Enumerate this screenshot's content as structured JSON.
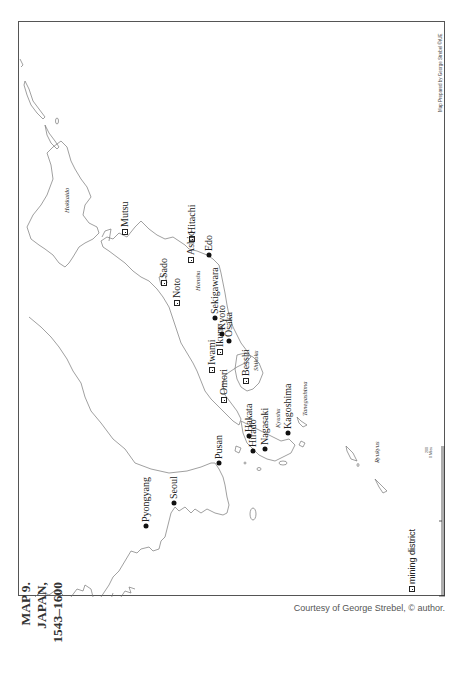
{
  "map": {
    "title_lines": [
      "MAP 9.",
      "JAPAN,",
      "1543–1600"
    ],
    "caption": "Courtesy of George Strebel, © author.",
    "credit_vertical": "Map Prepared by George Strebel  ©rUE",
    "legend": {
      "icon": "mining-district-icon",
      "label": "mining district"
    },
    "scale_bar": {
      "label_top": "200",
      "label_bottom": "0 Miles"
    },
    "colors": {
      "frame": "#555555",
      "coast": "#777777",
      "text": "#222222",
      "caption": "#555555"
    },
    "regions": [
      {
        "name": "Hokkaido",
        "x": 63,
        "y": 212
      },
      {
        "name": "Honshu",
        "x": 194,
        "y": 290
      },
      {
        "name": "Shikoku",
        "x": 252,
        "y": 370
      },
      {
        "name": "Kyushu",
        "x": 274,
        "y": 427
      },
      {
        "name": "Tanegashima",
        "x": 301,
        "y": 415
      },
      {
        "name": "Ryukyus",
        "x": 373,
        "y": 462
      }
    ],
    "mining_districts": [
      {
        "name": "Mutsu",
        "x": 124,
        "y": 231
      },
      {
        "name": "Hitachi",
        "x": 191,
        "y": 238
      },
      {
        "name": "Ashio",
        "x": 190,
        "y": 259
      },
      {
        "name": "Sado",
        "x": 163,
        "y": 282
      },
      {
        "name": "Noto",
        "x": 176,
        "y": 302
      },
      {
        "name": "Iwami",
        "x": 211,
        "y": 369
      },
      {
        "name": "Ikuno",
        "x": 219,
        "y": 351
      },
      {
        "name": "Omori",
        "x": 223,
        "y": 399
      },
      {
        "name": "Besshi",
        "x": 245,
        "y": 380
      }
    ],
    "cities": [
      {
        "name": "Edo",
        "x": 208,
        "y": 254
      },
      {
        "name": "Sekigawara",
        "x": 214,
        "y": 317
      },
      {
        "name": "Kyoto",
        "x": 221,
        "y": 333
      },
      {
        "name": "Osaka",
        "x": 228,
        "y": 340
      },
      {
        "name": "Hakata",
        "x": 248,
        "y": 435
      },
      {
        "name": "Nagasaki",
        "x": 264,
        "y": 448
      },
      {
        "name": "Hirado",
        "x": 252,
        "y": 450
      },
      {
        "name": "Kagoshima",
        "x": 287,
        "y": 432
      },
      {
        "name": "Pusan",
        "x": 218,
        "y": 462
      },
      {
        "name": "Seoul",
        "x": 173,
        "y": 502
      },
      {
        "name": "Pyongyang",
        "x": 145,
        "y": 525
      }
    ]
  }
}
